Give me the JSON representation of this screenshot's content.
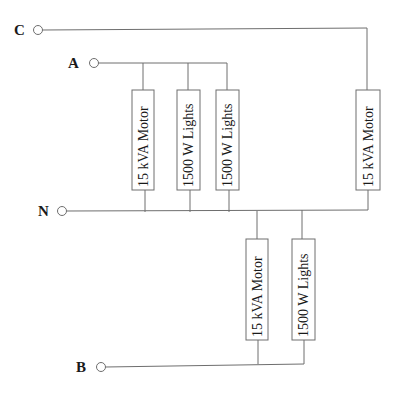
{
  "diagram": {
    "title": "",
    "terminals": [
      {
        "id": "C",
        "label": "C"
      },
      {
        "id": "A",
        "label": "A"
      },
      {
        "id": "N",
        "label": "N"
      },
      {
        "id": "B",
        "label": "B"
      }
    ],
    "loads": [
      {
        "phase": "A",
        "label": "15 kVA Motor"
      },
      {
        "phase": "A",
        "label": "1500 W Lights"
      },
      {
        "phase": "A",
        "label": "1500 W Lights"
      },
      {
        "phase": "C",
        "label": "15 kVA Motor"
      },
      {
        "phase": "B",
        "label": "15 kVA Motor"
      },
      {
        "phase": "B",
        "label": "1500 W Lights"
      }
    ],
    "colors": {
      "wire": "#6e6e6e",
      "text": "#1a1a1a",
      "background": "#ffffff"
    }
  }
}
